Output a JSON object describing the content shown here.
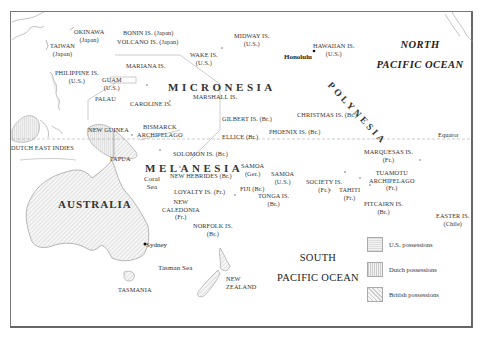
{
  "map": {
    "regions": {
      "micronesia": "MICRONESIA",
      "melanesia": "MELANESIA",
      "polynesia": "POLYNESIA"
    },
    "oceans": {
      "north_pacific": [
        "NORTH",
        "PACIFIC OCEAN"
      ],
      "south_pacific": [
        "SOUTH",
        "PACIFIC OCEAN"
      ]
    },
    "landmasses": {
      "australia": "AUSTRALIA",
      "new_guinea": "NEW GUINEA",
      "papua": "PAPUA",
      "dutch_east_indies": "DUTCH EAST INDIES",
      "tasmania": "TASMANIA",
      "new_zealand": [
        "NEW",
        "ZEALAND"
      ]
    },
    "seas": {
      "coral_sea": [
        "Coral",
        "Sea"
      ],
      "tasman_sea": "Tasman Sea"
    },
    "cities": {
      "honolulu": "Honolulu",
      "sydney": "Sydney"
    },
    "equator_label": "Equator",
    "islands": [
      {
        "id": "okinawa",
        "name": "OKINAWA",
        "owner": "(Japan)"
      },
      {
        "id": "taiwan",
        "name": "TAIWAN",
        "owner": "(Japan)"
      },
      {
        "id": "bonin",
        "name": "BONIN IS. (Japan)",
        "owner": ""
      },
      {
        "id": "volcano",
        "name": "VOLCANO IS. (Japan)",
        "owner": ""
      },
      {
        "id": "philippine",
        "name": "PHILIPPINE IS.",
        "owner": "(U.S.)"
      },
      {
        "id": "mariana",
        "name": "MARIANA IS.",
        "owner": ""
      },
      {
        "id": "guam",
        "name": "GUAM",
        "owner": "(U.S.)"
      },
      {
        "id": "palau",
        "name": "PALAU",
        "owner": ""
      },
      {
        "id": "caroline",
        "name": "CAROLINE IS.",
        "owner": ""
      },
      {
        "id": "wake",
        "name": "WAKE IS.",
        "owner": "(U.S.)"
      },
      {
        "id": "midway",
        "name": "MIDWAY IS.",
        "owner": "(U.S.)"
      },
      {
        "id": "hawaiian",
        "name": "HAWAIIAN IS.",
        "owner": "(U.S.)"
      },
      {
        "id": "marshall",
        "name": "MARSHALL IS.",
        "owner": ""
      },
      {
        "id": "gilbert",
        "name": "GILBERT IS. (Br.)",
        "owner": ""
      },
      {
        "id": "christmas",
        "name": "CHRISTMAS IS. (Br.)",
        "owner": ""
      },
      {
        "id": "phoenix",
        "name": "PHOENIX IS. (Br.)",
        "owner": ""
      },
      {
        "id": "ellice",
        "name": "ELLICE (Br.)",
        "owner": ""
      },
      {
        "id": "bismarck",
        "name": "BISMARCK",
        "owner": "ARCHIPELAGO"
      },
      {
        "id": "solomon",
        "name": "SOLOMON IS. (Br.)",
        "owner": ""
      },
      {
        "id": "new_hebrides",
        "name": "NEW HEBRIDES (Br.)",
        "owner": ""
      },
      {
        "id": "loyalty",
        "name": "LOYALTY IS. (Fr.)",
        "owner": ""
      },
      {
        "id": "new_caledonia",
        "name": "NEW",
        "owner": "CALEDONIA",
        "extra": "(Fr.)"
      },
      {
        "id": "samoa_ger",
        "name": "SAMOA",
        "owner": "(Ger.)"
      },
      {
        "id": "samoa_us",
        "name": "SAMOA",
        "owner": "(U.S.)"
      },
      {
        "id": "fiji",
        "name": "FIJI (Br.)",
        "owner": ""
      },
      {
        "id": "tonga",
        "name": "TONGA IS.",
        "owner": "(Br.)"
      },
      {
        "id": "norfolk",
        "name": "NORFOLK IS.",
        "owner": "(Br.)"
      },
      {
        "id": "society",
        "name": "SOCIETY IS.",
        "owner": "(Fr.)"
      },
      {
        "id": "tahiti",
        "name": "TAHITI",
        "owner": "(Fr.)"
      },
      {
        "id": "marquesas",
        "name": "MARQUESAS IS.",
        "owner": "(Fr.)"
      },
      {
        "id": "tuamotu",
        "name": "TUAMOTU",
        "owner": "ARCHIPELAGO",
        "extra": "(Fr.)"
      },
      {
        "id": "pitcairn",
        "name": "PITCAIRN IS.",
        "owner": "(Br.)"
      },
      {
        "id": "easter",
        "name": "EASTER IS.",
        "owner": "(Chile)"
      }
    ],
    "legend": [
      {
        "label": "U.S. possessions",
        "pattern": "us"
      },
      {
        "label": "Dutch possessions",
        "pattern": "dutch"
      },
      {
        "label": "British possessions",
        "pattern": "british"
      }
    ]
  }
}
